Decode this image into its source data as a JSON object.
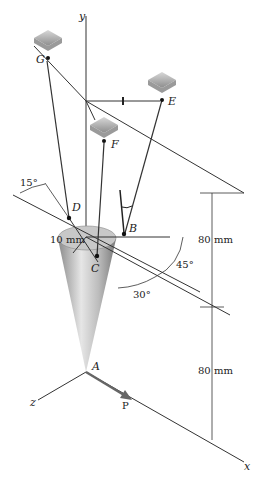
{
  "diagram": {
    "axes": {
      "x": "x",
      "y": "y",
      "z": "z"
    },
    "points": {
      "A": "A",
      "B": "B",
      "C": "C",
      "D": "D",
      "E": "E",
      "F": "F",
      "G": "G"
    },
    "force_label": "P",
    "dimensions": {
      "radius": "10 mm",
      "upper_height": "80 mm",
      "lower_height": "80 mm",
      "angle_15": "15°",
      "angle_45": "45°",
      "angle_30": "30°"
    },
    "colors": {
      "line": "#333333",
      "cone": "#b8b8b8",
      "support": "#a0a0a0"
    }
  }
}
